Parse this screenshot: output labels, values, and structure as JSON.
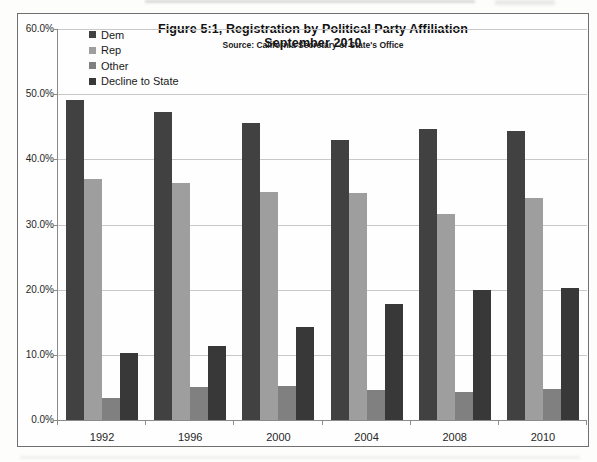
{
  "chart_data": {
    "type": "bar",
    "title": "Figure 5:1, Registration by Political Party Affiliation September 2010",
    "subtitle": "Source: California Secretary of State's Office",
    "categories": [
      "1992",
      "1996",
      "2000",
      "2004",
      "2008",
      "2010"
    ],
    "series": [
      {
        "name": "Dem",
        "color": "#414141",
        "values": [
          49.1,
          47.2,
          45.6,
          43.0,
          44.6,
          44.3
        ]
      },
      {
        "name": "Rep",
        "color": "#9e9e9e",
        "values": [
          37.0,
          36.3,
          35.0,
          34.8,
          31.6,
          34.0
        ]
      },
      {
        "name": "Other",
        "color": "#808080",
        "values": [
          3.4,
          5.0,
          5.2,
          4.6,
          4.3,
          4.7
        ]
      },
      {
        "name": "Decline to State",
        "color": "#383838",
        "values": [
          10.3,
          11.3,
          14.3,
          17.8,
          19.9,
          20.2
        ]
      }
    ],
    "ylim": [
      0,
      60
    ],
    "ytick_step": 10,
    "ytick_labels": [
      "60.0%",
      "50.0%",
      "40.0%",
      "30.0%",
      "20.0%",
      "10.0%",
      "0.0%"
    ],
    "xlabel": "",
    "ylabel": "",
    "legend_position": "top-left",
    "grid": "horizontal",
    "colors": {
      "gridline": "#c8c8c8",
      "axis": "#8a8a8a",
      "frame_border": "#707070",
      "text": "#1a1a1a"
    }
  }
}
